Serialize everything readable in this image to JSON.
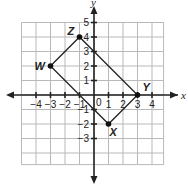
{
  "diagram": {
    "type": "coordinate-plane",
    "axes": {
      "x_label": "x",
      "y_label": "y",
      "origin_label": "0"
    },
    "x_ticks": [
      "-4",
      "-3",
      "-2",
      "-1",
      "1",
      "2",
      "3",
      "4"
    ],
    "y_ticks": [
      "5",
      "4",
      "3",
      "2",
      "1",
      "-1",
      "-2",
      "-3"
    ],
    "points": [
      {
        "label": "Z",
        "x": -1,
        "y": 4
      },
      {
        "label": "W",
        "x": -3,
        "y": 2
      },
      {
        "label": "X",
        "x": 1,
        "y": -2
      },
      {
        "label": "Y",
        "x": 3,
        "y": 0
      }
    ],
    "shape": "rectangle WXYZ"
  }
}
